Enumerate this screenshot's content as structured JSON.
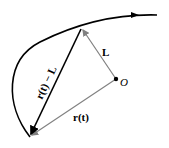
{
  "diagram": {
    "labels": {
      "L": "L",
      "r_t": "r(t)",
      "r_t_minus_L": "r(t) − L",
      "origin": "O"
    },
    "colors": {
      "curve": "#000000",
      "vector_r_minus_L": "#000000",
      "vector_gray": "#808080"
    }
  }
}
